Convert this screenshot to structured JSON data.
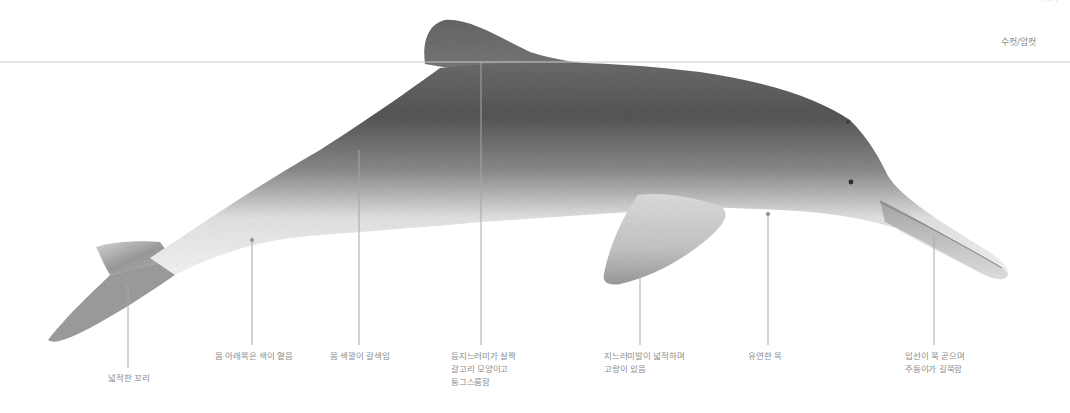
{
  "header": {
    "corner_text": "(잘려 보이는 상단 텍스트)",
    "corner_bold": "",
    "sex_label": "수컷/암컷"
  },
  "illustration": {
    "subject": "dolphin-side-view",
    "colors": {
      "body_dark": "#4a4a4a",
      "body_mid": "#8f8f8f",
      "belly_light": "#f2f2f2",
      "leader_line": "#a8a8a8",
      "water_line": "#c8c8c8"
    }
  },
  "annotations": [
    {
      "id": "tail",
      "lines": [
        "넓적한 꼬리"
      ]
    },
    {
      "id": "belly",
      "lines": [
        "몸 아래쪽은 색이 옅음"
      ]
    },
    {
      "id": "body-color",
      "lines": [
        "몸 색깔이 갈색임"
      ]
    },
    {
      "id": "dorsal-fin",
      "lines": [
        "등지느러미가 살짝",
        "갈고리 모양이고",
        "둥그스름함"
      ]
    },
    {
      "id": "flipper",
      "lines": [
        "지느러미발이 넓적하며",
        "고랑이 있음"
      ]
    },
    {
      "id": "neck",
      "lines": [
        "유연한 목"
      ]
    },
    {
      "id": "beak",
      "lines": [
        "입선이 쭉 곧으며",
        "주둥이가 길쭉함"
      ]
    }
  ]
}
